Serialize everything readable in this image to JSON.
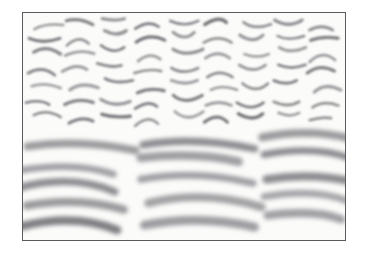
{
  "figure": {
    "kind": "texture-segregation-stimulus",
    "caption": "",
    "frame": {
      "x": 22,
      "y": 12,
      "width": 324,
      "height": 229,
      "border_color": "#5b5b5f",
      "border_width": 1
    },
    "background_color": "#fbfbfa",
    "outer_background_color": "#ffffff",
    "stroke_color": "#6e6e72",
    "stroke_color_dark": "#55555a",
    "regions": [
      {
        "name": "upper-texture-region",
        "label": "fine-scale randomly-oriented strokes",
        "y_start": 0,
        "y_end": 120,
        "stroke_count": 118,
        "scale": "small",
        "orientation": "random",
        "mean_length": 26,
        "mean_width": 3.1,
        "blur": 1.1
      },
      {
        "name": "lower-texture-region",
        "label": "coarse-scale horizontally-flowing strokes",
        "y_start": 120,
        "y_end": 229,
        "stroke_count": 34,
        "scale": "large",
        "orientation": "near-horizontal",
        "mean_length": 92,
        "mean_width": 8.4,
        "blur": 2.2
      }
    ]
  },
  "chart_data": {
    "type": "scatter",
    "title": "",
    "xlabel": "",
    "ylabel": "",
    "grid": false,
    "legend": "none",
    "xlim": [
      0,
      324
    ],
    "ylim": [
      0,
      229
    ],
    "series": [
      {
        "name": "fine-strokes",
        "color": "#6e6e72",
        "width": 3.0,
        "blur": 1.1,
        "strokes": [
          [
            10,
            14,
            22,
            6,
            36,
            10
          ],
          [
            42,
            8,
            56,
            4,
            70,
            12
          ],
          [
            78,
            6,
            92,
            12,
            104,
            6
          ],
          [
            112,
            16,
            126,
            8,
            140,
            14
          ],
          [
            150,
            6,
            164,
            12,
            178,
            6
          ],
          [
            186,
            14,
            200,
            6,
            212,
            12
          ],
          [
            220,
            8,
            232,
            16,
            246,
            10
          ],
          [
            254,
            6,
            268,
            12,
            282,
            6
          ],
          [
            290,
            14,
            302,
            8,
            314,
            14
          ],
          [
            6,
            26,
            20,
            34,
            34,
            26
          ],
          [
            44,
            30,
            56,
            22,
            70,
            28
          ],
          [
            80,
            20,
            94,
            28,
            106,
            20
          ],
          [
            114,
            32,
            128,
            24,
            142,
            30
          ],
          [
            152,
            22,
            164,
            30,
            176,
            22
          ],
          [
            184,
            30,
            198,
            22,
            210,
            30
          ],
          [
            218,
            24,
            232,
            32,
            244,
            24
          ],
          [
            254,
            22,
            266,
            30,
            280,
            22
          ],
          [
            288,
            30,
            300,
            22,
            314,
            28
          ],
          [
            8,
            42,
            22,
            36,
            34,
            44
          ],
          [
            44,
            46,
            58,
            38,
            70,
            44
          ],
          [
            80,
            36,
            92,
            44,
            106,
            38
          ],
          [
            116,
            48,
            128,
            40,
            140,
            46
          ],
          [
            150,
            38,
            164,
            46,
            176,
            38
          ],
          [
            186,
            46,
            198,
            38,
            212,
            46
          ],
          [
            220,
            40,
            234,
            48,
            246,
            40
          ],
          [
            256,
            38,
            268,
            46,
            280,
            38
          ],
          [
            290,
            46,
            302,
            38,
            314,
            44
          ],
          [
            6,
            58,
            20,
            52,
            32,
            60
          ],
          [
            42,
            62,
            56,
            54,
            68,
            60
          ],
          [
            78,
            52,
            92,
            60,
            104,
            54
          ],
          [
            114,
            64,
            128,
            56,
            140,
            62
          ],
          [
            150,
            54,
            162,
            62,
            176,
            54
          ],
          [
            186,
            62,
            198,
            54,
            210,
            62
          ],
          [
            218,
            56,
            232,
            64,
            244,
            56
          ],
          [
            254,
            54,
            268,
            62,
            280,
            54
          ],
          [
            288,
            62,
            300,
            54,
            314,
            60
          ],
          [
            8,
            74,
            22,
            68,
            34,
            76
          ],
          [
            44,
            78,
            58,
            70,
            70,
            76
          ],
          [
            80,
            68,
            92,
            76,
            106,
            70
          ],
          [
            116,
            80,
            128,
            72,
            140,
            78
          ],
          [
            150,
            70,
            164,
            78,
            176,
            70
          ],
          [
            186,
            78,
            198,
            70,
            212,
            78
          ],
          [
            220,
            72,
            234,
            80,
            246,
            72
          ],
          [
            256,
            70,
            268,
            78,
            280,
            70
          ],
          [
            290,
            78,
            302,
            70,
            314,
            76
          ],
          [
            6,
            90,
            20,
            84,
            32,
            92
          ],
          [
            42,
            94,
            56,
            86,
            68,
            92
          ],
          [
            78,
            84,
            92,
            92,
            104,
            86
          ],
          [
            114,
            96,
            128,
            88,
            140,
            94
          ],
          [
            150,
            86,
            162,
            94,
            176,
            86
          ],
          [
            186,
            94,
            198,
            86,
            210,
            94
          ],
          [
            218,
            88,
            232,
            96,
            244,
            88
          ],
          [
            254,
            86,
            268,
            94,
            280,
            86
          ],
          [
            288,
            94,
            300,
            86,
            314,
            92
          ],
          [
            8,
            106,
            22,
            100,
            34,
            108
          ],
          [
            44,
            110,
            58,
            102,
            70,
            108
          ],
          [
            80,
            100,
            92,
            108,
            106,
            102
          ],
          [
            116,
            112,
            128,
            104,
            140,
            110
          ],
          [
            150,
            102,
            164,
            110,
            176,
            102
          ],
          [
            186,
            110,
            198,
            102,
            212,
            110
          ],
          [
            220,
            104,
            234,
            112,
            246,
            104
          ],
          [
            256,
            102,
            268,
            110,
            280,
            102
          ],
          [
            290,
            110,
            302,
            102,
            314,
            108
          ]
        ]
      },
      {
        "name": "coarse-strokes",
        "color": "#727277",
        "width": 8.0,
        "blur": 2.2,
        "strokes": [
          [
            6,
            136,
            56,
            124,
            104,
            140
          ],
          [
            118,
            130,
            170,
            120,
            222,
            134
          ],
          [
            238,
            128,
            288,
            118,
            322,
            130
          ],
          [
            2,
            156,
            54,
            144,
            108,
            160
          ],
          [
            120,
            150,
            176,
            140,
            228,
            154
          ],
          [
            244,
            146,
            294,
            136,
            324,
            150
          ],
          [
            0,
            176,
            52,
            164,
            106,
            180
          ],
          [
            118,
            170,
            174,
            160,
            226,
            174
          ],
          [
            242,
            166,
            292,
            156,
            324,
            170
          ],
          [
            4,
            196,
            56,
            184,
            110,
            200
          ],
          [
            122,
            190,
            178,
            180,
            230,
            194
          ],
          [
            246,
            186,
            296,
            176,
            324,
            190
          ],
          [
            2,
            214,
            54,
            204,
            108,
            218
          ],
          [
            120,
            210,
            176,
            200,
            228,
            212
          ],
          [
            244,
            206,
            294,
            196,
            324,
            210
          ]
        ]
      }
    ]
  }
}
